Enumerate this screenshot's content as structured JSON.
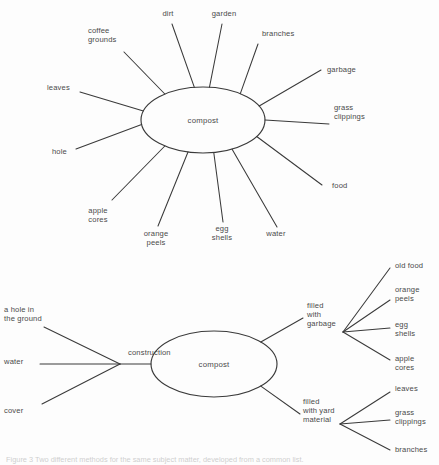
{
  "page": {
    "background_color": "#fdfdfd",
    "ink_color": "#3a3a3a",
    "text_color": "#4a4a4a"
  },
  "figures": [
    {
      "id": "figure-top",
      "type": "radial-web",
      "center_label": "compost",
      "center": {
        "cx": 203,
        "cy": 120,
        "rx": 62,
        "ry": 33
      },
      "spokes": [
        {
          "label": "coffee grounds",
          "lines": [
            "coffee",
            "grounds"
          ],
          "angle_deg": 232,
          "label_x": 88,
          "label_y": 33,
          "anchor": "start",
          "tip_x": 124,
          "tip_y": 52
        },
        {
          "label": "dirt",
          "lines": [
            "dirt"
          ],
          "angle_deg": 262,
          "label_x": 168,
          "label_y": 16,
          "anchor": "middle",
          "tip_x": 172,
          "tip_y": 24
        },
        {
          "label": "garden",
          "lines": [
            "garden"
          ],
          "angle_deg": 276,
          "label_x": 224,
          "label_y": 16,
          "anchor": "middle",
          "tip_x": 222,
          "tip_y": 24
        },
        {
          "label": "branches",
          "lines": [
            "branches"
          ],
          "angle_deg": 307,
          "label_x": 262,
          "label_y": 36,
          "anchor": "start",
          "tip_x": 258,
          "tip_y": 44
        },
        {
          "label": "garbage",
          "lines": [
            "garbage"
          ],
          "angle_deg": 335,
          "label_x": 327,
          "label_y": 72,
          "anchor": "start",
          "tip_x": 321,
          "tip_y": 70
        },
        {
          "label": "grass clippings",
          "lines": [
            "grass",
            "clippings"
          ],
          "angle_deg": 0,
          "label_x": 334,
          "label_y": 110,
          "anchor": "start",
          "tip_x": 329,
          "tip_y": 124
        },
        {
          "label": "food",
          "lines": [
            "food"
          ],
          "angle_deg": 30,
          "label_x": 332,
          "label_y": 188,
          "anchor": "start",
          "tip_x": 322,
          "tip_y": 185
        },
        {
          "label": "water",
          "lines": [
            "water"
          ],
          "angle_deg": 62,
          "label_x": 276,
          "label_y": 236,
          "anchor": "middle",
          "tip_x": 277,
          "tip_y": 227
        },
        {
          "label": "egg shells",
          "lines": [
            "egg",
            "shells"
          ],
          "angle_deg": 80,
          "label_x": 222,
          "label_y": 231,
          "anchor": "middle",
          "tip_x": 223,
          "tip_y": 222
        },
        {
          "label": "orange peels",
          "lines": [
            "orange",
            "peels"
          ],
          "angle_deg": 104,
          "label_x": 156,
          "label_y": 236,
          "anchor": "middle",
          "tip_x": 158,
          "tip_y": 226
        },
        {
          "label": "apple cores",
          "lines": [
            "apple",
            "cores"
          ],
          "angle_deg": 128,
          "label_x": 98,
          "label_y": 213,
          "anchor": "middle",
          "tip_x": 112,
          "tip_y": 200
        },
        {
          "label": "hole",
          "lines": [
            "hole"
          ],
          "angle_deg": 172,
          "label_x": 52,
          "label_y": 154,
          "anchor": "start",
          "tip_x": 76,
          "tip_y": 149
        },
        {
          "label": "leaves",
          "lines": [
            "leaves"
          ],
          "angle_deg": 196,
          "label_x": 47,
          "label_y": 90,
          "anchor": "start",
          "tip_x": 80,
          "tip_y": 92
        }
      ]
    },
    {
      "id": "figure-bottom",
      "type": "fishbone",
      "center_label": "compost",
      "center": {
        "cx": 214,
        "cy": 364,
        "rx": 63,
        "ry": 33
      },
      "left_branch_label": "construction",
      "left_branch_label_pos": {
        "x": 128,
        "y": 355
      },
      "left_inputs": [
        {
          "label": "a hole in the ground",
          "lines": [
            "a hole in",
            "the ground"
          ],
          "label_x": 4,
          "label_y": 312,
          "tip_x": 44,
          "tip_y": 327
        },
        {
          "label": "water",
          "lines": [
            "water"
          ],
          "label_x": 4,
          "label_y": 364,
          "tip_x": 40,
          "tip_y": 364
        },
        {
          "label": "cover",
          "lines": [
            "cover"
          ],
          "label_x": 4,
          "label_y": 413,
          "tip_x": 42,
          "tip_y": 404
        }
      ],
      "right_groups": [
        {
          "label": "filled with garbage",
          "lines": [
            "filled",
            "with",
            "garbage"
          ],
          "label_x": 307,
          "label_y": 308,
          "hub_x": 303,
          "hub_y": 318,
          "children": [
            {
              "label": "old food",
              "lines": [
                "old food"
              ],
              "label_x": 395,
              "label_y": 268,
              "tip_x": 390,
              "tip_y": 268
            },
            {
              "label": "orange peels",
              "lines": [
                "orange",
                "peels"
              ],
              "label_x": 395,
              "label_y": 292,
              "tip_x": 390,
              "tip_y": 300
            },
            {
              "label": "egg shells",
              "lines": [
                "egg",
                "shells"
              ],
              "label_x": 395,
              "label_y": 327,
              "tip_x": 390,
              "tip_y": 328
            },
            {
              "label": "apple cores",
              "lines": [
                "apple",
                "cores"
              ],
              "label_x": 395,
              "label_y": 361,
              "tip_x": 390,
              "tip_y": 360
            }
          ]
        },
        {
          "label": "filled with yard material",
          "lines": [
            "filled",
            "with yard",
            "material"
          ],
          "label_x": 303,
          "label_y": 404,
          "hub_x": 300,
          "hub_y": 414,
          "children": [
            {
              "label": "leaves",
              "lines": [
                "leaves"
              ],
              "label_x": 395,
              "label_y": 391,
              "tip_x": 390,
              "tip_y": 392
            },
            {
              "label": "grass clippings",
              "lines": [
                "grass",
                "clippings"
              ],
              "label_x": 395,
              "label_y": 415,
              "tip_x": 390,
              "tip_y": 420
            },
            {
              "label": "branches",
              "lines": [
                "branches"
              ],
              "label_x": 395,
              "label_y": 452,
              "tip_x": 390,
              "tip_y": 450
            }
          ]
        }
      ]
    }
  ],
  "caption": {
    "text": "Figure 3   Two different methods for the same subject matter, developed from a common list."
  }
}
